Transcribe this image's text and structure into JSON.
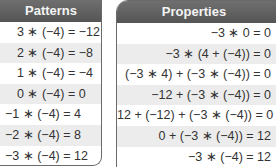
{
  "patterns": {
    "title": "Patterns",
    "rows": [
      "3 ∗ (−4) = −12",
      "2 ∗ (−4) = −8",
      "1 ∗ (−4) = −4",
      "0 ∗ (−4) = 0",
      "−1 ∗ (−4) = 4",
      "−2 ∗ (−4) = 8",
      "−3 ∗ (−4) = 12"
    ]
  },
  "properties": {
    "title": "Properties",
    "rows": [
      "−3 ∗ 0 = 0",
      "−3 ∗ (4 + (−4)) = 0",
      "(−3 ∗ 4) + (−3 ∗ (−4)) = 0",
      "−12 + (−3 ∗ (−4)) = 0",
      "12 + (−12) + (−3 ∗ (−4)) = 0",
      "0 + (−3 ∗ (−4)) = 12",
      "−3 ∗ (−4) = 12"
    ]
  },
  "colors": {
    "header_bg": "#606060",
    "header_text": "#f4f4f4",
    "alt_row": "#ececec",
    "border": "#6a6a6a"
  }
}
